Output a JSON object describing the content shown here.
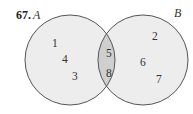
{
  "problem": {
    "number": "67."
  },
  "sets": {
    "A": {
      "label": "A",
      "only": [
        "1",
        "4",
        "3"
      ]
    },
    "B": {
      "label": "B",
      "only": [
        "2",
        "6",
        "7"
      ]
    },
    "intersection": [
      "5",
      "8"
    ]
  },
  "colors": {
    "circle_fill": "#ededed",
    "intersection_fill": "#cfcfcf",
    "stroke": "#555555"
  }
}
